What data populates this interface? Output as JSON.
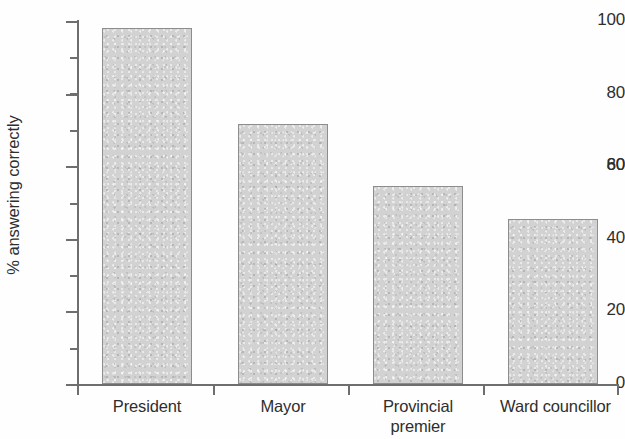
{
  "chart_data": {
    "type": "bar",
    "title": "",
    "subtitle": "",
    "xlabel": "",
    "ylabel": "% answering correctly",
    "categories": [
      "President",
      "Mayor",
      "Provincial\npremier",
      "Ward councillor"
    ],
    "values": [
      98,
      71.5,
      54.5,
      45.5
    ],
    "ylim": [
      0,
      100
    ],
    "y_major_ticks": [
      0,
      20,
      40,
      60,
      80,
      100
    ],
    "y_minor_ticks": [
      10,
      30,
      50,
      70,
      90
    ],
    "y_tick_labels": [
      "0",
      "20",
      "40",
      "60",
      "80",
      "100"
    ],
    "grid": false,
    "legend": null,
    "bar_fill_color": "#d2d2d2",
    "bar_edge_color": "#8d8d8d",
    "axis_color": "#6e6e6e",
    "background_color": "#fefefe"
  },
  "axes": {
    "y_label": "% answering correctly",
    "tick_labels": {
      "t0": "0",
      "t20": "20",
      "t40": "40",
      "t60": "60",
      "t80": "80",
      "t100": "100"
    }
  },
  "bars": [
    {
      "label": "President",
      "value": 98,
      "value_text": "98"
    },
    {
      "label": "Mayor",
      "value": 71.5,
      "value_text": "71.5"
    },
    {
      "label": "Provincial\npremier",
      "value": 54.5,
      "value_text": "54.5"
    },
    {
      "label": "Ward councillor",
      "value": 45.5,
      "value_text": "45.5"
    }
  ]
}
